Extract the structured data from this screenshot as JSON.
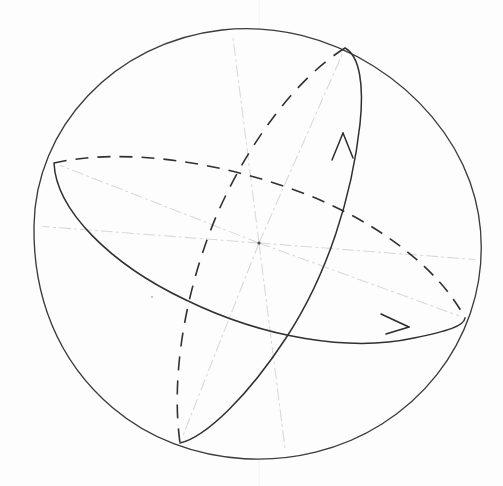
{
  "figure": {
    "medium": "hand-drawn pencil sketch",
    "background_color": "#fdfdfd",
    "stroke_color": "#2f2f34",
    "faint_axis_color": "#d8d8dc",
    "canvas": {
      "width": 503,
      "height": 486
    }
  },
  "sphere": {
    "name": "sphere-outline",
    "center": {
      "x": 259,
      "y": 243
    },
    "radius": 225,
    "left": 34,
    "right": 484,
    "top": 28,
    "bottom": 458,
    "style": "solid"
  },
  "orbits": [
    {
      "id": "equatorial-orbit",
      "label": "horizontal great circle",
      "vertex_left": {
        "x": 54,
        "y": 163
      },
      "vertex_right": {
        "x": 465,
        "y": 318
      },
      "semi_major": 220,
      "semi_minor": 62,
      "rotation_deg": 20.5,
      "front_half_style": "solid",
      "back_half_style": "dashed",
      "arrow": {
        "id": "equatorial-arrow",
        "direction": "right",
        "tip": {
          "x": 409,
          "y": 326
        }
      }
    },
    {
      "id": "meridional-orbit",
      "label": "tilted great circle",
      "vertex_top": {
        "x": 345,
        "y": 48
      },
      "vertex_bottom": {
        "x": 180,
        "y": 443
      },
      "semi_major": 214,
      "semi_minor": 66,
      "rotation_deg": 112.7,
      "front_half_style": "solid",
      "back_half_style": "dashed",
      "arrow": {
        "id": "meridional-arrow",
        "direction": "up",
        "tip": {
          "x": 344,
          "y": 134
        }
      }
    }
  ],
  "axes": {
    "id": "center-axes",
    "style": "dash-dot faint",
    "origin": {
      "x": 259,
      "y": 243
    },
    "endpoints": [
      {
        "x": 54,
        "y": 163
      },
      {
        "x": 465,
        "y": 318
      },
      {
        "x": 345,
        "y": 48
      },
      {
        "x": 180,
        "y": 443
      },
      {
        "x": 232,
        "y": 30
      },
      {
        "x": 286,
        "y": 456
      },
      {
        "x": 36,
        "y": 226
      },
      {
        "x": 482,
        "y": 260
      }
    ]
  },
  "center_point": {
    "id": "sphere-center",
    "x": 259,
    "y": 243,
    "radius": 1.6
  },
  "stray_marks": [
    {
      "x": 152,
      "y": 297,
      "r": 1.1
    }
  ]
}
